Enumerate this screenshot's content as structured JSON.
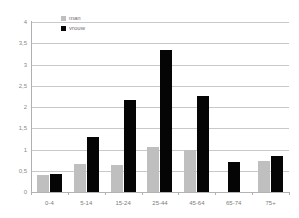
{
  "chart_data": {
    "type": "bar",
    "title": "",
    "subtitle": "",
    "xlabel": "",
    "ylabel": "",
    "categories": [
      "0-4",
      "5-14",
      "15-24",
      "25-44",
      "45-64",
      "65-74",
      "75+"
    ],
    "series": [
      {
        "name": "man",
        "color": "#bfbfbf",
        "values": [
          0.39,
          0.67,
          0.63,
          1.06,
          0.98,
          null,
          0.72
        ]
      },
      {
        "name": "vrouw",
        "color": "#050505",
        "values": [
          0.42,
          1.3,
          2.16,
          3.33,
          2.26,
          0.71,
          0.85
        ]
      }
    ],
    "ylim": [
      0,
      4
    ],
    "yticks": [
      0,
      0.5,
      1,
      1.5,
      2,
      2.5,
      3,
      3.5,
      4
    ],
    "ytick_labels": [
      "0",
      "0,5",
      "1",
      "1,5",
      "2",
      "2,5",
      "3",
      "3,5",
      "4"
    ],
    "grid": true,
    "grid_axis": "y",
    "legend_position": "top-left-inside",
    "annotations": []
  },
  "legend": {
    "entries": [
      {
        "label": "man",
        "swatch": "legend-swatch-man"
      },
      {
        "label": "vrouw",
        "swatch": "legend-swatch-vrouw"
      }
    ]
  },
  "colors": {
    "background": "#ffffff",
    "gridline": "#c9c9c9",
    "axis": "#b0b0b0",
    "tick_text": "#8a8a8a",
    "series_man": "#bfbfbf",
    "series_vrouw": "#050505"
  }
}
